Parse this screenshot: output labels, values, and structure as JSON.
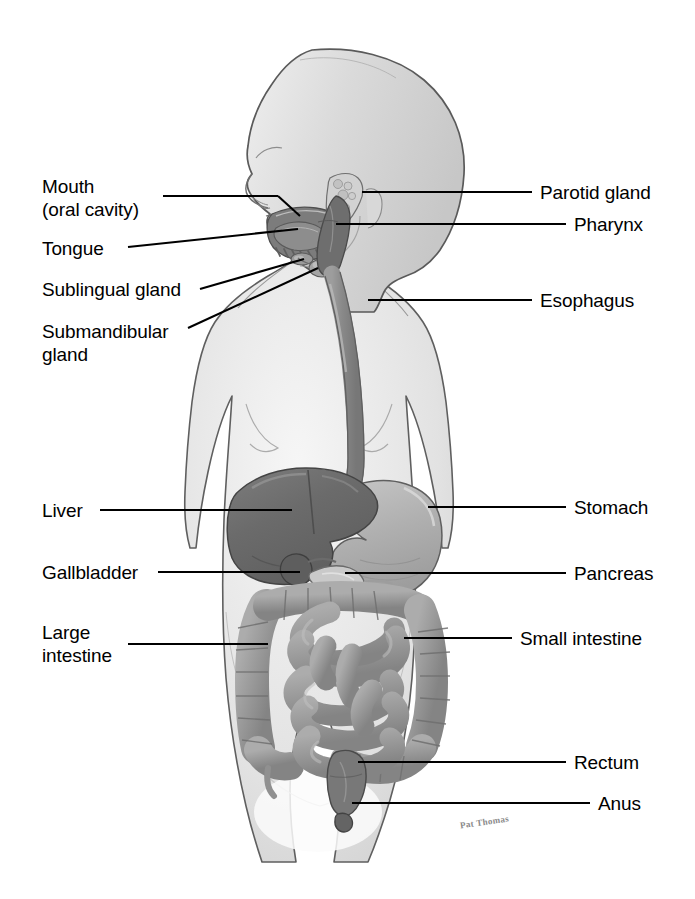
{
  "diagram": {
    "signature": "Pat\nThomas",
    "colors": {
      "body_fill": "#e4e4e4",
      "body_outline": "#5a5a5a",
      "liver": "#6f6f6f",
      "stomach": "#b3b3b3",
      "intestine": "#9b9b9b",
      "esophagus": "#8f8f8f",
      "oral": "#7d7d7d",
      "gland": "#cfcfcf",
      "leader_line": "#000000",
      "label_text": "#000000",
      "background": "#ffffff"
    }
  },
  "labels_left": [
    {
      "id": "mouth",
      "text": "Mouth\n(oral cavity)"
    },
    {
      "id": "tongue",
      "text": "Tongue"
    },
    {
      "id": "sublingual-gland",
      "text": "Sublingual gland"
    },
    {
      "id": "submandibular-gland",
      "text": "Submandibular\ngland"
    },
    {
      "id": "liver",
      "text": "Liver"
    },
    {
      "id": "gallbladder",
      "text": "Gallbladder"
    },
    {
      "id": "large-intestine",
      "text": "Large\nintestine"
    }
  ],
  "labels_right": [
    {
      "id": "parotid-gland",
      "text": "Parotid gland"
    },
    {
      "id": "pharynx",
      "text": "Pharynx"
    },
    {
      "id": "esophagus",
      "text": "Esophagus"
    },
    {
      "id": "stomach",
      "text": "Stomach"
    },
    {
      "id": "pancreas",
      "text": "Pancreas"
    },
    {
      "id": "small-intestine",
      "text": "Small intestine"
    },
    {
      "id": "rectum",
      "text": "Rectum"
    },
    {
      "id": "anus",
      "text": "Anus"
    }
  ]
}
